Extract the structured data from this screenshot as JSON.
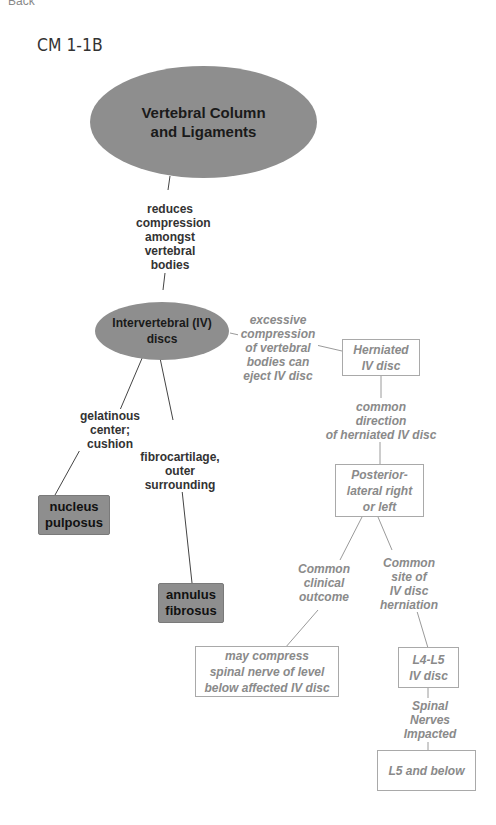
{
  "nav": {
    "back_label": "Back"
  },
  "page": {
    "title": "CM 1-1B"
  },
  "colors": {
    "dark_node": "#8e8e8e",
    "light_text": "#8a8a8a",
    "dark_text": "#1a1a1a",
    "line": "#444444",
    "light_line": "#9a9a9a"
  },
  "nodes": {
    "vertebral_column": "Vertebral Column\nand Ligaments",
    "iv_discs": "Intervertebral (IV)\ndiscs",
    "nucleus_pulposus": "nucleus\npulposus",
    "annulus_fibrosus": "annulus\nfibrosus",
    "herniated_disc": "Herniated\nIV disc",
    "posterior_lateral": "Posterior-\nlateral right\nor left",
    "may_compress": "may compress\nspinal nerve of level\nbelow affected IV disc",
    "l4_l5": "L4-L5\nIV disc",
    "l5_below": "L5 and below"
  },
  "links": {
    "reduces_compression": "reduces\ncompression\namongst\nvertebral\nbodies",
    "excessive_compression": "excessive\ncompression\nof vertebral\nbodies can\neject IV disc",
    "gelatinous_center": "gelatinous\ncenter;\ncushion",
    "fibrocartilage": "fibrocartilage,\nouter\nsurrounding",
    "common_direction": "common\ndirection\nof herniated IV disc",
    "clinical_outcome": "Common\nclinical\noutcome",
    "common_site": "Common\nsite of\nIV disc\nherniation",
    "spinal_nerves": "Spinal\nNerves\nImpacted"
  }
}
